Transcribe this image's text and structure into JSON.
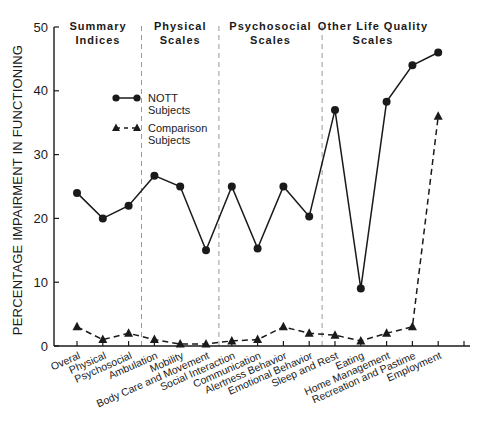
{
  "chart_data": {
    "type": "line",
    "title": "",
    "xlabel": "",
    "ylabel": "PERCENTAGE IMPAIRMENT IN FUNCTIONING",
    "ylim": [
      0,
      50
    ],
    "yticks": [
      0,
      10,
      20,
      30,
      40,
      50
    ],
    "grid": false,
    "legend_position": "upper-left-inside",
    "categories": [
      "Overall",
      "Physical",
      "Psychosocial",
      "Ambulation",
      "Mobility",
      "Body Care and Movement",
      "Social Interaction",
      "Communication",
      "Alertness Behavior",
      "Emotional Behavior",
      "Sleep and Rest",
      "Eating",
      "Home Management",
      "Recreation and Pastime",
      "Employment"
    ],
    "category_labels_display": [
      "Overal",
      "Physical",
      "Psychosocial",
      "Ambulation",
      "Mobility",
      "Body Care and Movement",
      "Social Interaction",
      "Communication",
      "Alertness Behavior",
      "Emotional Behavior",
      "Sleep and Rest",
      "Eating",
      "Home Management",
      "Recreation and Pastime",
      "Employment"
    ],
    "series": [
      {
        "name": "NOTT Subjects",
        "marker": "circle",
        "line": "solid",
        "values": [
          24,
          20,
          22,
          26.7,
          25,
          15,
          25,
          15.3,
          25,
          20.3,
          37,
          9,
          38.3,
          44,
          46
        ]
      },
      {
        "name": "Comparison Subjects",
        "marker": "triangle",
        "line": "dashed",
        "values": [
          3,
          1,
          2,
          1,
          0.3,
          0.3,
          0.8,
          1,
          3,
          2,
          1.7,
          0.8,
          2,
          3,
          36
        ]
      }
    ],
    "groups": [
      {
        "label_line1": "Summary",
        "label_line2": "Indices",
        "start_index": 0,
        "end_index": 2
      },
      {
        "label_line1": "Physical",
        "label_line2": "Scales",
        "start_index": 3,
        "end_index": 5
      },
      {
        "label_line1": "Psychosocial",
        "label_line2": "Scales",
        "start_index": 6,
        "end_index": 9
      },
      {
        "label_line1": "Other Life Quality",
        "label_line2": "Scales",
        "start_index": 10,
        "end_index": 14
      }
    ],
    "legend": [
      {
        "label_line1": "NOTT",
        "label_line2": "Subjects",
        "marker": "circle",
        "line": "solid"
      },
      {
        "label_line1": "Comparison",
        "label_line2": "Subjects",
        "marker": "triangle",
        "line": "dashed"
      }
    ]
  },
  "colors": {
    "ink": "#1a1a1a",
    "separator": "#9a9a9a",
    "background": "#ffffff"
  }
}
